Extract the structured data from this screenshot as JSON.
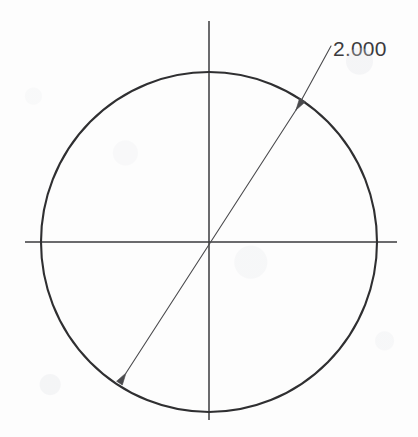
{
  "drawing": {
    "title": "Circle with diameter dimension",
    "background_color": "#fdfdfd",
    "geometry": {
      "circle": {
        "name": "circle-outline",
        "center_x": 209,
        "center_y": 242,
        "radius_x": 168,
        "radius_y": 170,
        "stroke_color": "#2f2f31",
        "stroke_width": 2.1
      },
      "horizontal_centerline": {
        "name": "horizontal-centerline",
        "x1": 25,
        "y1": 242,
        "x2": 397,
        "y2": 242,
        "stroke_color": "#3a3a3c",
        "stroke_width": 1.5
      },
      "vertical_centerline": {
        "name": "vertical-centerline",
        "x1": 209,
        "y1": 21,
        "x2": 209,
        "y2": 420,
        "stroke_color": "#3a3a3c",
        "stroke_width": 1.5
      },
      "diameter_line": {
        "name": "diameter-dimension-line",
        "x1": 126,
        "y1": 373,
        "x2": 296,
        "y2": 110,
        "stroke_color": "#4a4a4d",
        "stroke_width": 1.1
      },
      "leader_line": {
        "name": "dimension-leader-line",
        "x1": 296,
        "y1": 110,
        "x2": 331,
        "y2": 46,
        "stroke_color": "#4a4a4d",
        "stroke_width": 1.1
      },
      "arrow_upper": {
        "name": "arrowhead-upper-right",
        "x": 296,
        "y": 110,
        "angle_deg": -57
      },
      "arrow_lower": {
        "name": "arrowhead-lower-left",
        "x": 126,
        "y": 373,
        "angle_deg": 123
      }
    },
    "annotation": {
      "dimension_value": "2.000",
      "text_x": 333,
      "text_y": 56,
      "text_color": "#3b3b3d",
      "font_size_px": 21
    }
  }
}
